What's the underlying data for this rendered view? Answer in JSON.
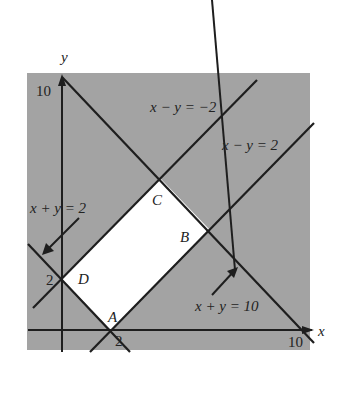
{
  "diagram": {
    "colors": {
      "panel": "#a3a3a3",
      "feasible": "#ffffff",
      "line": "#1e1e1e"
    },
    "axes": {
      "x_label": "x",
      "y_label": "y",
      "x_tick": "10",
      "y_tick": "10",
      "x_tick_2": "2",
      "y_tick_2": "2"
    },
    "lines": {
      "l1": "x − y = −2",
      "l2": "x − y = 2",
      "l3": "x + y = 2",
      "l4": "x + y = 10"
    },
    "vertices": {
      "A": "A",
      "B": "B",
      "C": "C",
      "D": "D"
    }
  }
}
